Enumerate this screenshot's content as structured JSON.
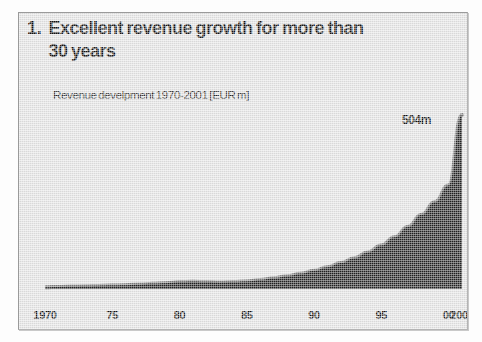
{
  "slide": {
    "number": "1.",
    "title_line1": "Excellent revenue growth for more than",
    "title_line2": "30 years",
    "subtitle": "Revenue develpment 1970-2001 [EUR m]",
    "peak_label": "504m"
  },
  "colors": {
    "slide_background": "#e4e4e4",
    "area_fill": "#222222",
    "area_edge": "#7d7d7d",
    "frame_border": "#9a9a9a",
    "text": "#111111"
  },
  "chart_data": {
    "type": "area",
    "title": "Excellent revenue growth for more than 30 years",
    "subtitle": "Revenue develpment 1970-2001 [EUR m]",
    "xlabel": "",
    "ylabel": "Revenue [EUR m]",
    "legend": [],
    "grid": false,
    "xlim": [
      1970,
      2001
    ],
    "ylim": [
      0,
      504
    ],
    "tick_labels": [
      "1970",
      "75",
      "80",
      "85",
      "90",
      "95",
      "00",
      "2001"
    ],
    "tick_years": [
      1970,
      1975,
      1980,
      1985,
      1990,
      1995,
      2000,
      2001
    ],
    "annotations": [
      {
        "text": "504m",
        "x": 2001,
        "y": 504
      }
    ],
    "x": [
      1970,
      1971,
      1972,
      1973,
      1974,
      1975,
      1976,
      1977,
      1978,
      1979,
      1980,
      1981,
      1982,
      1983,
      1984,
      1985,
      1986,
      1987,
      1988,
      1989,
      1990,
      1991,
      1992,
      1993,
      1994,
      1995,
      1996,
      1997,
      1998,
      1999,
      2000,
      2001
    ],
    "values": [
      5,
      6,
      7,
      8,
      9,
      10,
      11,
      13,
      15,
      17,
      20,
      21,
      20,
      19,
      20,
      22,
      26,
      31,
      37,
      44,
      53,
      63,
      75,
      89,
      106,
      126,
      150,
      180,
      215,
      252,
      300,
      504
    ],
    "series": [
      {
        "name": "Revenue",
        "values": [
          5,
          6,
          7,
          8,
          9,
          10,
          11,
          13,
          15,
          17,
          20,
          21,
          20,
          19,
          20,
          22,
          26,
          31,
          37,
          44,
          53,
          63,
          75,
          89,
          106,
          126,
          150,
          180,
          215,
          252,
          300,
          504
        ]
      }
    ]
  }
}
